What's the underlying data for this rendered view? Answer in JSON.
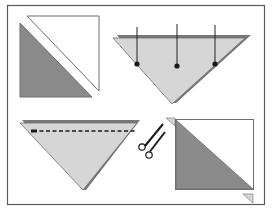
{
  "diagram": {
    "title": "",
    "colors": {
      "frame": "#5a5a5a",
      "dark_fabric": "#8a8a8a",
      "light_fabric": "#d6d6d6",
      "white_fabric": "#ffffff",
      "outline": "#6e6e6e",
      "pin": "#1a1a1a"
    },
    "steps": [
      {
        "id": "step-1",
        "description": "Two squares cut on the diagonal: white triangle and dark triangle"
      },
      {
        "id": "step-2",
        "description": "Triangles layered right sides together and pinned along the long edge",
        "pins": 3
      },
      {
        "id": "step-3",
        "description": "Stitch along the long edge (dashed seam line)"
      },
      {
        "id": "step-4",
        "description": "Trim dog-ears with scissors; pressed half-square triangle unit"
      }
    ]
  }
}
